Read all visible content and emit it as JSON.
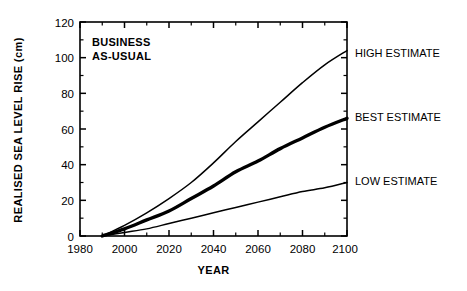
{
  "chart_data": {
    "type": "line",
    "title": "",
    "annotation": "BUSINESS AS-USUAL",
    "annotation_line1": "BUSINESS",
    "annotation_line2": "AS-USUAL",
    "xlabel": "YEAR",
    "ylabel": "REALISED SEA LEVEL RISE (cm)",
    "xlim": [
      1980,
      2100
    ],
    "ylim": [
      0,
      120
    ],
    "xticks": [
      1980,
      2000,
      2020,
      2040,
      2060,
      2080,
      2100
    ],
    "xtick_labels": [
      "1980",
      "2000",
      "2020",
      "2040",
      "2060",
      "2080",
      "2100"
    ],
    "xminor_step": 10,
    "yticks": [
      0,
      20,
      40,
      60,
      80,
      100,
      120
    ],
    "ytick_labels": [
      "0",
      "20",
      "40",
      "60",
      "80",
      "100",
      "120"
    ],
    "yminor_step": 10,
    "grid": false,
    "legend_position": "right-inline",
    "x": [
      1990,
      2000,
      2010,
      2020,
      2030,
      2040,
      2050,
      2060,
      2070,
      2080,
      2090,
      2100
    ],
    "series": [
      {
        "name": "HIGH ESTIMATE",
        "label": "HIGH ESTIMATE",
        "color": "#000000",
        "line_width": 1.5,
        "values": [
          0,
          6,
          13,
          21,
          30,
          41,
          53,
          64,
          75,
          86,
          96,
          104
        ]
      },
      {
        "name": "BEST ESTIMATE",
        "label": "BEST ESTIMATE",
        "color": "#000000",
        "line_width": 3.4,
        "values": [
          0,
          4,
          9,
          14,
          21,
          28,
          36,
          42,
          49,
          55,
          61,
          66
        ]
      },
      {
        "name": "LOW ESTIMATE",
        "label": "LOW ESTIMATE",
        "color": "#000000",
        "line_width": 1.5,
        "values": [
          0,
          2,
          4,
          7,
          10,
          13,
          16,
          19,
          22,
          25,
          27,
          30
        ]
      }
    ]
  },
  "labels": {
    "high": "HIGH ESTIMATE",
    "best": "BEST ESTIMATE",
    "low": "LOW ESTIMATE",
    "ylabel": "REALISED SEA LEVEL RISE (cm)",
    "xlabel": "YEAR",
    "annot1": "BUSINESS",
    "annot2": "AS-USUAL",
    "y0": "0",
    "y20": "20",
    "y40": "40",
    "y60": "60",
    "y80": "80",
    "y100": "100",
    "y120": "120",
    "x1980": "1980",
    "x2000": "2000",
    "x2020": "2020",
    "x2040": "2040",
    "x2060": "2060",
    "x2080": "2080",
    "x2100": "2100"
  }
}
